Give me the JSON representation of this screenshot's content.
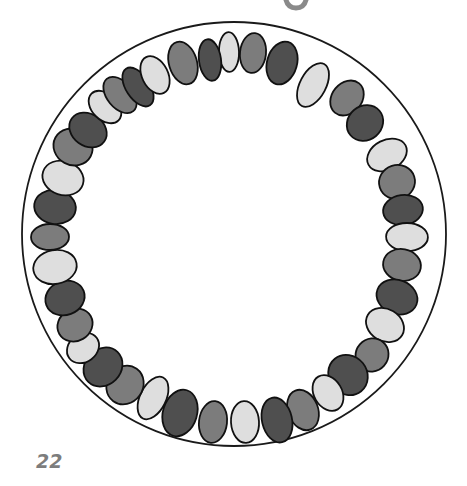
{
  "page": {
    "page_number": "22"
  },
  "illustration": {
    "description": "Circle of hand-drawn beads (necklace) in alternating shades",
    "outer_circle": {
      "cx": 234,
      "cy": 234,
      "r": 212,
      "stroke": "#1a1a1a"
    },
    "palette": {
      "dark": "#4f4f4f",
      "medium": "#7c7c7c",
      "light": "#dedede",
      "outline": "#111111"
    },
    "pattern": [
      "light",
      "medium",
      "dark"
    ],
    "beads": [
      {
        "x": 229,
        "y": 52,
        "shade": "light",
        "rx": 10,
        "ry": 21
      },
      {
        "x": 253,
        "y": 53,
        "shade": "medium",
        "rx": 13,
        "ry": 21
      },
      {
        "x": 282,
        "y": 63,
        "shade": "dark",
        "rx": 15,
        "ry": 23
      },
      {
        "x": 313,
        "y": 85,
        "shade": "light",
        "rx": 13,
        "ry": 25
      },
      {
        "x": 347,
        "y": 98,
        "shade": "medium",
        "rx": 15,
        "ry": 20
      },
      {
        "x": 365,
        "y": 123,
        "shade": "dark",
        "rx": 20,
        "ry": 17
      },
      {
        "x": 387,
        "y": 155,
        "shade": "light",
        "rx": 22,
        "ry": 15
      },
      {
        "x": 397,
        "y": 182,
        "shade": "medium",
        "rx": 19,
        "ry": 17
      },
      {
        "x": 403,
        "y": 210,
        "shade": "dark",
        "rx": 21,
        "ry": 15
      },
      {
        "x": 407,
        "y": 237,
        "shade": "light",
        "rx": 22,
        "ry": 14
      },
      {
        "x": 402,
        "y": 265,
        "shade": "medium",
        "rx": 20,
        "ry": 16
      },
      {
        "x": 397,
        "y": 297,
        "shade": "dark",
        "rx": 22,
        "ry": 17
      },
      {
        "x": 385,
        "y": 325,
        "shade": "light",
        "rx": 21,
        "ry": 16
      },
      {
        "x": 372,
        "y": 355,
        "shade": "medium",
        "rx": 17,
        "ry": 17
      },
      {
        "x": 348,
        "y": 375,
        "shade": "dark",
        "rx": 19,
        "ry": 22
      },
      {
        "x": 328,
        "y": 393,
        "shade": "light",
        "rx": 14,
        "ry": 20
      },
      {
        "x": 303,
        "y": 410,
        "shade": "medium",
        "rx": 15,
        "ry": 22
      },
      {
        "x": 277,
        "y": 420,
        "shade": "dark",
        "rx": 15,
        "ry": 24
      },
      {
        "x": 245,
        "y": 422,
        "shade": "light",
        "rx": 14,
        "ry": 22
      },
      {
        "x": 213,
        "y": 422,
        "shade": "medium",
        "rx": 14,
        "ry": 22
      },
      {
        "x": 180,
        "y": 413,
        "shade": "dark",
        "rx": 17,
        "ry": 25
      },
      {
        "x": 153,
        "y": 398,
        "shade": "light",
        "rx": 13,
        "ry": 24
      },
      {
        "x": 125,
        "y": 385,
        "shade": "medium",
        "rx": 18,
        "ry": 21
      },
      {
        "x": 103,
        "y": 367,
        "shade": "dark",
        "rx": 18,
        "ry": 22
      },
      {
        "x": 83,
        "y": 348,
        "shade": "light",
        "rx": 18,
        "ry": 14
      },
      {
        "x": 75,
        "y": 325,
        "shade": "medium",
        "rx": 19,
        "ry": 16
      },
      {
        "x": 65,
        "y": 298,
        "shade": "dark",
        "rx": 21,
        "ry": 17
      },
      {
        "x": 55,
        "y": 267,
        "shade": "light",
        "rx": 23,
        "ry": 17
      },
      {
        "x": 50,
        "y": 237,
        "shade": "medium",
        "rx": 20,
        "ry": 13
      },
      {
        "x": 55,
        "y": 207,
        "shade": "dark",
        "rx": 22,
        "ry": 17
      },
      {
        "x": 63,
        "y": 178,
        "shade": "light",
        "rx": 22,
        "ry": 17
      },
      {
        "x": 73,
        "y": 147,
        "shade": "medium",
        "rx": 18,
        "ry": 21
      },
      {
        "x": 88,
        "y": 130,
        "shade": "dark",
        "rx": 16,
        "ry": 21
      },
      {
        "x": 105,
        "y": 107,
        "shade": "light",
        "rx": 13,
        "ry": 20
      },
      {
        "x": 120,
        "y": 95,
        "shade": "medium",
        "rx": 13,
        "ry": 22
      },
      {
        "x": 138,
        "y": 87,
        "shade": "dark",
        "rx": 12,
        "ry": 23
      },
      {
        "x": 155,
        "y": 75,
        "shade": "light",
        "rx": 13,
        "ry": 21
      },
      {
        "x": 183,
        "y": 63,
        "shade": "medium",
        "rx": 14,
        "ry": 23
      },
      {
        "x": 210,
        "y": 60,
        "shade": "dark",
        "rx": 11,
        "ry": 22
      }
    ]
  }
}
